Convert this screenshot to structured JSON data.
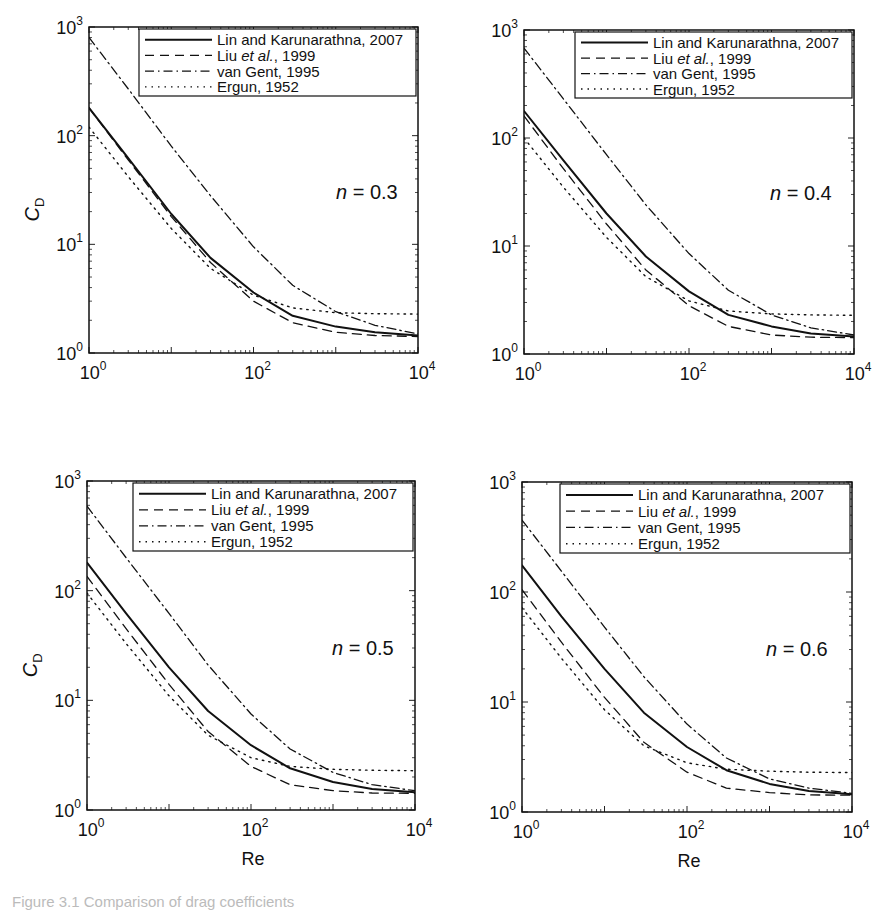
{
  "chart_data": [
    {
      "type": "line",
      "title": "",
      "annotation": "n = 0.3",
      "n_value": "0.3",
      "xlabel": "",
      "ylabel": "C_D",
      "xscale": "log",
      "yscale": "log",
      "xlim": [
        1,
        10000
      ],
      "ylim": [
        1,
        1000
      ],
      "x_ticks": [
        "10^0",
        "10^2",
        "10^4"
      ],
      "y_ticks": [
        "10^0",
        "10^1",
        "10^2",
        "10^3"
      ],
      "grid": false,
      "legend_position": "upper right",
      "x": [
        1,
        3,
        10,
        30,
        100,
        300,
        1000,
        3000,
        10000
      ],
      "series": [
        {
          "name": "Lin and Karunarathna, 2007",
          "style": "solid",
          "values": [
            180,
            62,
            19,
            7.5,
            3.6,
            2.2,
            1.75,
            1.55,
            1.45
          ]
        },
        {
          "name": "Liu et al., 1999",
          "style": "dashed",
          "values": [
            180,
            60,
            18,
            6.8,
            3.0,
            1.9,
            1.55,
            1.45,
            1.42
          ]
        },
        {
          "name": "van Gent, 1995",
          "style": "dashdot",
          "values": [
            800,
            270,
            80,
            28,
            9.5,
            4.2,
            2.4,
            1.8,
            1.5
          ]
        },
        {
          "name": "Ergun, 1952",
          "style": "dotted",
          "values": [
            120,
            42,
            14,
            6,
            3.4,
            2.6,
            2.35,
            2.3,
            2.28
          ]
        }
      ]
    },
    {
      "type": "line",
      "title": "",
      "annotation": "n = 0.4",
      "n_value": "0.4",
      "xlabel": "",
      "ylabel": "",
      "xscale": "log",
      "yscale": "log",
      "xlim": [
        1,
        10000
      ],
      "ylim": [
        1,
        1000
      ],
      "x_ticks": [
        "10^0",
        "10^2",
        "10^4"
      ],
      "y_ticks": [
        "10^0",
        "10^1",
        "10^2",
        "10^3"
      ],
      "grid": false,
      "legend_position": "upper right",
      "x": [
        1,
        3,
        10,
        30,
        100,
        300,
        1000,
        3000,
        10000
      ],
      "series": [
        {
          "name": "Lin and Karunarathna, 2007",
          "style": "solid",
          "values": [
            178,
            62,
            20,
            8,
            3.8,
            2.3,
            1.8,
            1.55,
            1.45
          ]
        },
        {
          "name": "Liu et al., 1999",
          "style": "dashed",
          "values": [
            160,
            52,
            16,
            6,
            2.8,
            1.8,
            1.5,
            1.43,
            1.42
          ]
        },
        {
          "name": "van Gent, 1995",
          "style": "dashdot",
          "values": [
            680,
            230,
            70,
            24,
            8.5,
            3.9,
            2.3,
            1.75,
            1.5
          ]
        },
        {
          "name": "Ergun, 1952",
          "style": "dotted",
          "values": [
            100,
            35,
            12,
            5.2,
            3.1,
            2.5,
            2.35,
            2.3,
            2.28
          ]
        }
      ]
    },
    {
      "type": "line",
      "title": "",
      "annotation": "n = 0.5",
      "n_value": "0.5",
      "xlabel": "Re",
      "ylabel": "C_D",
      "xscale": "log",
      "yscale": "log",
      "xlim": [
        1,
        10000
      ],
      "ylim": [
        1,
        1000
      ],
      "x_ticks": [
        "10^0",
        "10^2",
        "10^4"
      ],
      "y_ticks": [
        "10^0",
        "10^1",
        "10^2",
        "10^3"
      ],
      "grid": false,
      "legend_position": "upper right",
      "x": [
        1,
        3,
        10,
        30,
        100,
        300,
        1000,
        3000,
        10000
      ],
      "series": [
        {
          "name": "Lin and Karunarathna, 2007",
          "style": "solid",
          "values": [
            180,
            62,
            20,
            8,
            3.9,
            2.4,
            1.8,
            1.55,
            1.45
          ]
        },
        {
          "name": "Liu et al., 1999",
          "style": "dashed",
          "values": [
            135,
            45,
            14,
            5.2,
            2.5,
            1.7,
            1.5,
            1.43,
            1.42
          ]
        },
        {
          "name": "van Gent, 1995",
          "style": "dashdot",
          "values": [
            590,
            200,
            62,
            21,
            7.5,
            3.6,
            2.2,
            1.7,
            1.5
          ]
        },
        {
          "name": "Ergun, 1952",
          "style": "dotted",
          "values": [
            95,
            33,
            11,
            4.8,
            3.0,
            2.5,
            2.35,
            2.3,
            2.28
          ]
        }
      ]
    },
    {
      "type": "line",
      "title": "",
      "annotation": "n = 0.6",
      "n_value": "0.6",
      "xlabel": "Re",
      "ylabel": "",
      "xscale": "log",
      "yscale": "log",
      "xlim": [
        1,
        10000
      ],
      "ylim": [
        1,
        1000
      ],
      "x_ticks": [
        "10^0",
        "10^2",
        "10^4"
      ],
      "y_ticks": [
        "10^0",
        "10^1",
        "10^2",
        "10^3"
      ],
      "grid": false,
      "legend_position": "upper right",
      "x": [
        1,
        3,
        10,
        30,
        100,
        300,
        1000,
        3000,
        10000
      ],
      "series": [
        {
          "name": "Lin and Karunarathna, 2007",
          "style": "solid",
          "values": [
            175,
            60,
            20,
            8,
            3.9,
            2.4,
            1.8,
            1.55,
            1.45
          ]
        },
        {
          "name": "Liu et al., 1999",
          "style": "dashed",
          "values": [
            105,
            35,
            11,
            4.3,
            2.3,
            1.65,
            1.5,
            1.43,
            1.42
          ]
        },
        {
          "name": "van Gent, 1995",
          "style": "dashdot",
          "values": [
            450,
            155,
            48,
            17,
            6.3,
            3.1,
            2.0,
            1.65,
            1.48
          ]
        },
        {
          "name": "Ergun, 1952",
          "style": "dotted",
          "values": [
            72,
            25,
            8.5,
            4,
            2.8,
            2.45,
            2.35,
            2.3,
            2.28
          ]
        }
      ]
    }
  ],
  "labels": {
    "ylabel_main": "C",
    "ylabel_sub": "D",
    "xlabel": "Re",
    "n_symbol": "n",
    "tick_base": "10",
    "legend": [
      {
        "prefix": "Lin and Karunarathna, 2007",
        "italic": "",
        "suffix": ""
      },
      {
        "prefix": "Liu ",
        "italic": "et al.",
        "suffix": ", 1999"
      },
      {
        "prefix": "van Gent, 1995",
        "italic": "",
        "suffix": ""
      },
      {
        "prefix": "Ergun, 1952",
        "italic": "",
        "suffix": ""
      }
    ]
  },
  "caption": "Figure 3.1  Comparison of drag coefficients"
}
